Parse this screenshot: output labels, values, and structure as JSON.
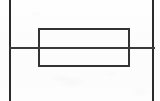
{
  "document": {
    "kind": "scanned-line-drawing",
    "title": "",
    "description": "Scanned technical line drawing: an open rectangle centered on a horizontal rule, bounded left and right by two full-height vertical rules.",
    "width": 160,
    "height": 101,
    "has_text": false,
    "text_content": ""
  },
  "colors": {
    "background": "#fdfdfd",
    "paper": "#fefefe",
    "stroke_vertical": "#2b2b2b",
    "stroke_horizontal": "#3a3a3a",
    "stroke_rectangle": "#333333"
  },
  "figure": {
    "elements": [
      {
        "id": "vline-left",
        "label": "left vertical rule",
        "shape": "line",
        "orientation": "vertical",
        "x": 9,
        "y_start": 0,
        "y_end": 101,
        "thickness": 2,
        "color": "#2b2b2b"
      },
      {
        "id": "vline-right",
        "label": "right vertical rule",
        "shape": "line",
        "orientation": "vertical",
        "x": 152,
        "y_start": 0,
        "y_end": 101,
        "thickness": 2,
        "color": "#2b2b2b"
      },
      {
        "id": "hline-mid",
        "label": "horizontal rule",
        "shape": "line",
        "orientation": "horizontal",
        "y": 47,
        "x_start": 9,
        "x_end": 155,
        "thickness": 2,
        "color": "#3a3a3a"
      },
      {
        "id": "rectangle",
        "label": "open rectangle",
        "shape": "rectangle",
        "x": 38,
        "y": 28,
        "width": 92,
        "height": 39,
        "fill": "none",
        "stroke_width": 2,
        "color": "#333333"
      }
    ]
  }
}
